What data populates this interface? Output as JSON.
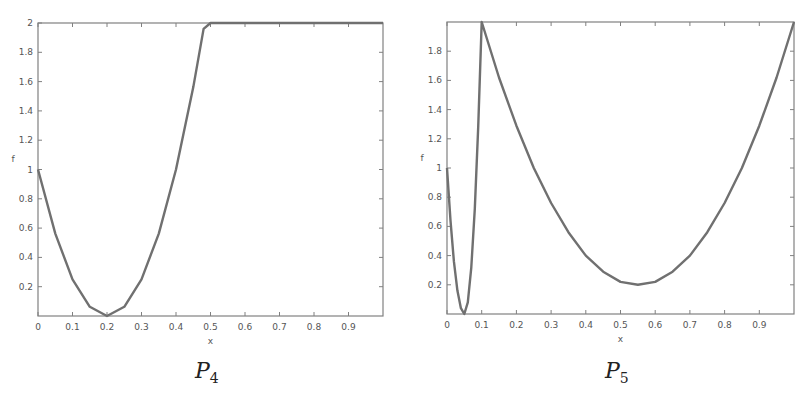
{
  "chart_data": [
    {
      "type": "line",
      "title": "",
      "caption": "P",
      "caption_sub": "4",
      "xlabel": "x",
      "ylabel": "f",
      "xlim": [
        0,
        1
      ],
      "ylim": [
        0,
        2
      ],
      "x_ticks": [
        "0",
        "0.1",
        "0.2",
        "0.3",
        "0.4",
        "0.5",
        "0.6",
        "0.7",
        "0.8",
        "0.9"
      ],
      "y_ticks": [
        "0.2",
        "0.4",
        "0.6",
        "0.8",
        "1",
        "1.2",
        "1.4",
        "1.6",
        "1.8",
        "2"
      ],
      "grid": false,
      "legend": null,
      "series": [
        {
          "name": "f",
          "color": "#707070",
          "x": [
            0,
            0.05,
            0.1,
            0.15,
            0.2,
            0.25,
            0.3,
            0.35,
            0.4,
            0.45,
            0.48,
            0.5,
            0.6,
            0.7,
            0.8,
            0.9,
            1.0
          ],
          "y": [
            1.0,
            0.5625,
            0.25,
            0.0625,
            0.0,
            0.0625,
            0.25,
            0.5625,
            1.0,
            1.5625,
            1.96,
            2.0,
            2.0,
            2.0,
            2.0,
            2.0,
            2.0
          ]
        }
      ]
    },
    {
      "type": "line",
      "title": "",
      "caption": "P",
      "caption_sub": "5",
      "xlabel": "x",
      "ylabel": "f",
      "xlim": [
        0,
        1
      ],
      "ylim": [
        0,
        2
      ],
      "x_ticks": [
        "0",
        "0.1",
        "0.2",
        "0.3",
        "0.4",
        "0.5",
        "0.6",
        "0.7",
        "0.8",
        "0.9"
      ],
      "y_ticks": [
        "0.2",
        "0.4",
        "0.6",
        "0.8",
        "1",
        "1.2",
        "1.4",
        "1.6",
        "1.8"
      ],
      "grid": false,
      "legend": null,
      "series": [
        {
          "name": "f",
          "color": "#707070",
          "x": [
            0,
            0.01,
            0.02,
            0.03,
            0.04,
            0.05,
            0.06,
            0.07,
            0.08,
            0.09,
            0.1,
            0.15,
            0.2,
            0.25,
            0.3,
            0.35,
            0.4,
            0.45,
            0.5,
            0.55,
            0.6,
            0.65,
            0.7,
            0.75,
            0.8,
            0.85,
            0.9,
            0.95,
            1.0
          ],
          "y": [
            1.0,
            0.64,
            0.36,
            0.16,
            0.04,
            0.0,
            0.08,
            0.32,
            0.72,
            1.28,
            2.0,
            1.62,
            1.29,
            1.0,
            0.76,
            0.56,
            0.4,
            0.29,
            0.22,
            0.2,
            0.22,
            0.29,
            0.4,
            0.56,
            0.76,
            1.0,
            1.29,
            1.62,
            2.0
          ]
        }
      ]
    }
  ]
}
